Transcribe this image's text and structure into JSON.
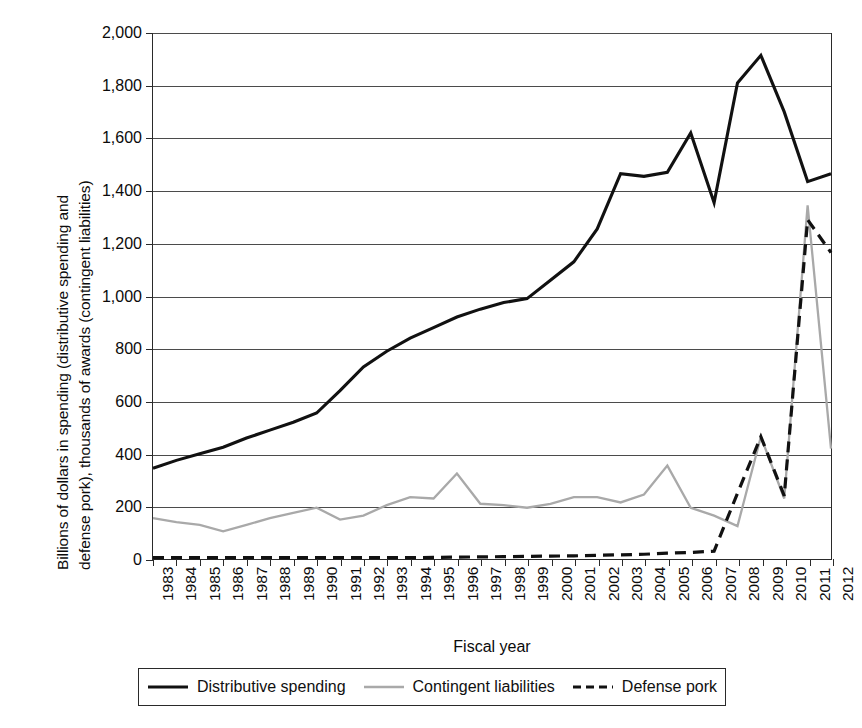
{
  "chart_data": {
    "type": "line",
    "title": "",
    "xlabel": "Fiscal year",
    "ylabel": "Billions of dollars in spending (distributive spending and\ndefense pork), thousands of awards (contingent liabilities)",
    "x": [
      1983,
      1984,
      1985,
      1986,
      1987,
      1988,
      1989,
      1990,
      1991,
      1992,
      1993,
      1994,
      1995,
      1996,
      1997,
      1998,
      1999,
      2000,
      2001,
      2002,
      2003,
      2004,
      2005,
      2006,
      2007,
      2008,
      2009,
      2010,
      2011,
      2012
    ],
    "categories": [
      "1983",
      "1984",
      "1985",
      "1986",
      "1987",
      "1988",
      "1989",
      "1990",
      "1991",
      "1992",
      "1993",
      "1994",
      "1995",
      "1996",
      "1997",
      "1998",
      "1999",
      "2000",
      "2001",
      "2002",
      "2003",
      "2004",
      "2005",
      "2006",
      "2007",
      "2008",
      "2009",
      "2010",
      "2011",
      "2012"
    ],
    "ylim": [
      0,
      2000
    ],
    "xlim": [
      1983,
      2012
    ],
    "yticks": [
      0,
      200,
      400,
      600,
      800,
      1000,
      1200,
      1400,
      1600,
      1800,
      2000
    ],
    "ytick_labels": [
      "0",
      "200",
      "400",
      "600",
      "800",
      "1,000",
      "1,200",
      "1,400",
      "1,600",
      "1,800",
      "2,000"
    ],
    "grid": true,
    "legend_position": "below-plot",
    "series": [
      {
        "name": "Distributive spending",
        "color": "#111111",
        "style": "solid",
        "width": 3.1,
        "values": [
          345,
          375,
          400,
          425,
          460,
          490,
          520,
          555,
          640,
          730,
          790,
          840,
          880,
          920,
          950,
          975,
          990,
          1060,
          1130,
          1255,
          1465,
          1455,
          1470,
          1620,
          1355,
          1810,
          1915,
          1700,
          1435,
          1465
        ]
      },
      {
        "name": "Contingent liabilities",
        "color": "#a9a9a9",
        "style": "solid",
        "width": 2.3,
        "values": [
          155,
          140,
          130,
          105,
          130,
          155,
          175,
          195,
          150,
          165,
          205,
          235,
          230,
          325,
          210,
          205,
          195,
          210,
          235,
          235,
          215,
          245,
          355,
          195,
          165,
          125,
          465,
          230,
          1345,
          420
        ]
      },
      {
        "name": "Defense pork",
        "color": "#111111",
        "style": "dashed",
        "width": 3.2,
        "values": [
          5,
          5,
          5,
          5,
          5,
          5,
          5,
          5,
          5,
          5,
          5,
          5,
          6,
          7,
          8,
          9,
          10,
          11,
          12,
          14,
          16,
          18,
          22,
          25,
          30,
          250,
          465,
          240,
          1290,
          1165
        ]
      }
    ]
  },
  "axis": {
    "ytick_labels": [
      "2,000",
      "1,800",
      "1,600",
      "1,400",
      "1,200",
      "1,000",
      "800",
      "600",
      "400",
      "200",
      "0"
    ],
    "xtick_labels": [
      "1983",
      "1984",
      "1985",
      "1986",
      "1987",
      "1988",
      "1989",
      "1990",
      "1991",
      "1992",
      "1993",
      "1994",
      "1995",
      "1996",
      "1997",
      "1998",
      "1999",
      "2000",
      "2001",
      "2002",
      "2003",
      "2004",
      "2005",
      "2006",
      "2007",
      "2008",
      "2009",
      "2010",
      "2011",
      "2012"
    ],
    "xlabel": "Fiscal year",
    "ylabel": "Billions of dollars in spending (distributive spending and\ndefense pork), thousands of awards (contingent liabilities)"
  },
  "legend": {
    "items": [
      {
        "label": "Distributive spending",
        "swatch": "solid-black-line-swatch"
      },
      {
        "label": "Contingent liabilities",
        "swatch": "solid-gray-line-swatch"
      },
      {
        "label": "Defense pork",
        "swatch": "dashed-black-line-swatch"
      }
    ]
  }
}
